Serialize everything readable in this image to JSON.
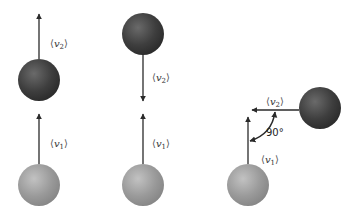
{
  "colors": {
    "ball_dark": "#3e3e3e",
    "ball_dark_highlight": "#6a6a6a",
    "ball_light": "#9a9a9a",
    "ball_light_highlight": "#c2c2c2",
    "arrow": "#2a2a2a"
  },
  "panels": [
    {
      "name": "panel-parallel",
      "balls": [
        {
          "kind": "dark",
          "cx": 39,
          "cy": 80,
          "r": 21
        },
        {
          "kind": "light",
          "cx": 39,
          "cy": 185,
          "r": 21
        }
      ],
      "vectors": [
        {
          "label": "v",
          "sub": "2",
          "from": [
            39,
            59
          ],
          "to": [
            39,
            14
          ],
          "label_pos": [
            50,
            39
          ]
        },
        {
          "label": "v",
          "sub": "1",
          "from": [
            39,
            164
          ],
          "to": [
            39,
            114
          ],
          "label_pos": [
            50,
            139
          ]
        }
      ]
    },
    {
      "name": "panel-antiparallel",
      "balls": [
        {
          "kind": "dark",
          "cx": 143,
          "cy": 34,
          "r": 21
        },
        {
          "kind": "light",
          "cx": 143,
          "cy": 185,
          "r": 21
        }
      ],
      "vectors": [
        {
          "label": "v",
          "sub": "2",
          "from": [
            143,
            55
          ],
          "to": [
            143,
            101
          ],
          "label_pos": [
            152,
            73
          ]
        },
        {
          "label": "v",
          "sub": "1",
          "from": [
            143,
            164
          ],
          "to": [
            143,
            114
          ],
          "label_pos": [
            152,
            139
          ]
        }
      ]
    },
    {
      "name": "panel-perpendicular",
      "balls": [
        {
          "kind": "dark",
          "cx": 320,
          "cy": 108,
          "r": 21
        },
        {
          "kind": "light",
          "cx": 248,
          "cy": 185,
          "r": 21
        }
      ],
      "vectors": [
        {
          "label": "v",
          "sub": "2",
          "from": [
            299,
            110
          ],
          "to": [
            252,
            110
          ],
          "label_pos": [
            264,
            98
          ]
        },
        {
          "label": "v",
          "sub": "1",
          "from": [
            248,
            164
          ],
          "to": [
            248,
            117
          ],
          "label_pos": [
            262,
            155
          ]
        }
      ],
      "angle": {
        "text": "90°",
        "label_pos": [
          266,
          128
        ]
      }
    }
  ]
}
